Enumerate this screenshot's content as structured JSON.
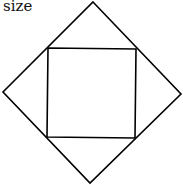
{
  "caption": "size",
  "diagram": {
    "outer_square": {
      "points": "93,2 181,94 90,183 3,92",
      "stroke": "#000000"
    },
    "inner_square": {
      "points": "48,48 136,49 135,138 47,137",
      "stroke": "#000000"
    }
  }
}
